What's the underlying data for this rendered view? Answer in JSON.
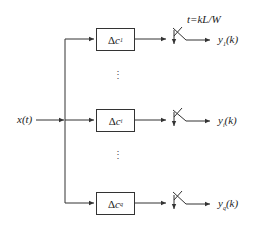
{
  "diagram": {
    "input_label": "x(t)",
    "sample_label": "t=kL/W",
    "delta": "Δ",
    "branches": [
      {
        "box_var": "c",
        "box_sub": "1",
        "out_var": "y",
        "out_sub": "1",
        "out_arg": "(k)"
      },
      {
        "box_var": "c",
        "box_sub": "i",
        "out_var": "y",
        "out_sub": "i",
        "out_arg": "(k)"
      },
      {
        "box_var": "c",
        "box_sub": "q",
        "out_var": "y",
        "out_sub": "q",
        "out_arg": "(k)"
      }
    ],
    "ellipsis": "⋮"
  },
  "colors": {
    "line": "#333333",
    "text": "#222222"
  }
}
